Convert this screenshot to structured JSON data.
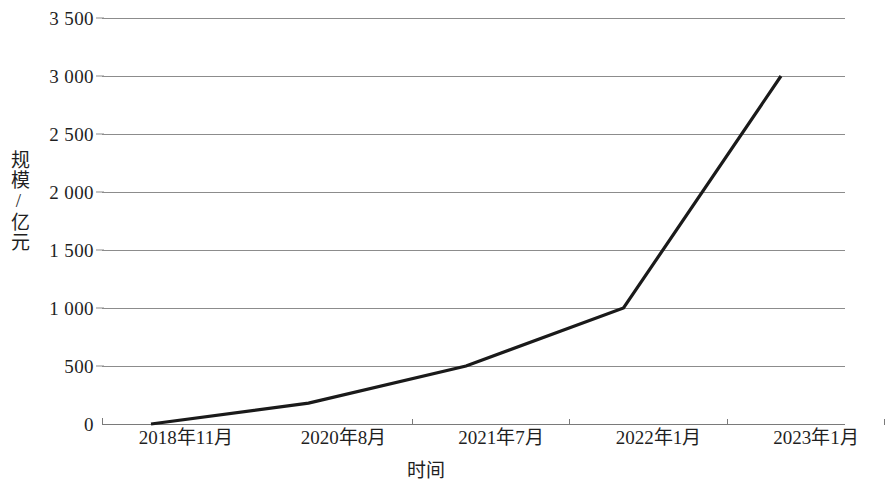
{
  "chart_data": {
    "type": "line",
    "title": "",
    "subtitle": "",
    "xlabel": "时间",
    "ylabel": "规模/亿元",
    "categories": [
      "2018年11月",
      "2020年8月",
      "2021年7月",
      "2022年1月",
      "2023年1月"
    ],
    "series": [
      {
        "name": "规模",
        "values": [
          0,
          180,
          500,
          1000,
          3000
        ]
      }
    ],
    "ylim": [
      0,
      3500
    ],
    "ytick_values": [
      0,
      500,
      1000,
      1500,
      2000,
      2500,
      3000,
      3500
    ],
    "ytick_labels": [
      "0",
      "500",
      "1 000",
      "1 500",
      "2 000",
      "2 500",
      "3 000",
      "3 500"
    ],
    "grid": true,
    "grid_axis": "y",
    "legend": false,
    "legend_position": "none",
    "line_color": "#1a1a1a",
    "grid_color": "#8c8c8c",
    "axis_color": "#7a7a7a",
    "background_color": "#ffffff",
    "markers": false
  },
  "axis": {
    "y_title": "规模/亿元",
    "x_title": "时间",
    "ticks_y": [
      {
        "label": "3 500",
        "value": 3500
      },
      {
        "label": "3 000",
        "value": 3000
      },
      {
        "label": "2 500",
        "value": 2500
      },
      {
        "label": "2 000",
        "value": 2000
      },
      {
        "label": "1 500",
        "value": 1500
      },
      {
        "label": "1 000",
        "value": 1000
      },
      {
        "label": "500",
        "value": 500
      },
      {
        "label": "0",
        "value": 0
      }
    ],
    "ticks_x": [
      {
        "label": "2018年11月"
      },
      {
        "label": "2020年8月"
      },
      {
        "label": "2021年7月"
      },
      {
        "label": "2022年1月"
      },
      {
        "label": "2023年1月"
      }
    ]
  }
}
